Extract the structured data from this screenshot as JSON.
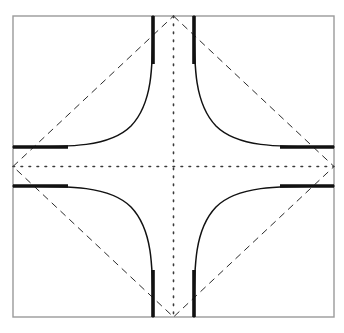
{
  "figure": {
    "canvas": {
      "width": 344,
      "height": 333,
      "background": "#ffffff"
    },
    "frame": {
      "name": "outer-square-border",
      "left": 13,
      "top": 16,
      "right": 334,
      "bottom": 317,
      "color": "#9a9a9a",
      "stroke_width": 1.4
    },
    "center": {
      "x": 173.5,
      "y": 166.5
    },
    "midpoints": {
      "top": {
        "x": 173.5,
        "y": 16
      },
      "bottom": {
        "x": 173.5,
        "y": 317
      },
      "left": {
        "x": 13,
        "y": 166.5
      },
      "right": {
        "x": 334,
        "y": 166.5
      }
    },
    "diamond": {
      "name": "dashed-diamond",
      "color": "#2b2b2b",
      "stroke_width": 1.0,
      "dash_pattern": "7 5",
      "points": "173.5,16 334,166.5 173.5,317 13,166.5"
    },
    "dotted_cross": {
      "name": "dotted-axis-cross",
      "color": "#3a3a3a",
      "stroke_width": 1.6,
      "dash_pattern": "1.6 6.4",
      "vertical": {
        "x": 173.5,
        "y1": 16,
        "y2": 317
      },
      "horizontal": {
        "y": 166.5,
        "x1": 13,
        "x2": 334
      }
    },
    "asymptotes": {
      "name": "curve-asymptote-offsets",
      "vertical_left_x": 153,
      "vertical_right_x": 194,
      "horizontal_top_y": 147,
      "horizontal_bottom_y": 188,
      "offset_from_center": 20.5
    },
    "curves": {
      "name": "concave-corner-curves",
      "color": "#111111",
      "thin_stroke_width": 1.5,
      "thick_stroke_width": 3.6,
      "count": 4,
      "quadrants": [
        "top-left",
        "top-right",
        "bottom-left",
        "bottom-right"
      ],
      "paths": {
        "top_left": "M 153,16 C 153,70 152,104 131,126 C 110,147 72,147 13,147",
        "top_right": "M 194,16 C 194,70 195,104 216,126 C 237,147 275,147 334,147",
        "bottom_left": "M 153,317 C 153,263 152,229 131,207 C 110,186 72,186 13,186",
        "bottom_right": "M 194,317 C 194,263 195,229 216,207 C 237,186 275,186 334,186"
      },
      "thick_end_segments": {
        "top_left_vertical": {
          "x": 153,
          "y1": 16,
          "y2": 64
        },
        "top_right_vertical": {
          "x": 194,
          "y1": 16,
          "y2": 64
        },
        "bottom_left_vertical": {
          "x": 153,
          "y1": 317,
          "y2": 270
        },
        "bottom_right_vertical": {
          "x": 194,
          "y1": 317,
          "y2": 270
        },
        "left_top_horizontal": {
          "y": 147,
          "x1": 13,
          "x2": 68
        },
        "left_bottom_horizontal": {
          "y": 186,
          "x1": 13,
          "x2": 68
        },
        "right_top_horizontal": {
          "y": 147,
          "x1": 334,
          "x2": 280
        },
        "right_bottom_horizontal": {
          "y": 186,
          "x1": 334,
          "x2": 280
        }
      }
    }
  }
}
